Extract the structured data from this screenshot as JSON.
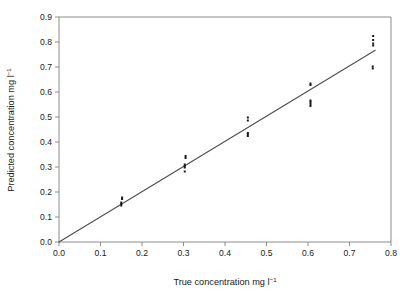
{
  "figure": {
    "background": "#ffffff",
    "frame_color": "#8c8c8c",
    "point_color": "#1a1a1a",
    "line_color": "#4d4d4d"
  },
  "chart_data": {
    "type": "scatter",
    "title": "",
    "xlabel_main": "True concentration mg l",
    "xlabel_sup": "−1",
    "ylabel_main": "Predicted concentration mg l",
    "ylabel_sup": "−1",
    "xlim": [
      0.0,
      0.8
    ],
    "ylim": [
      0.0,
      0.9
    ],
    "grid": false,
    "legend": "none",
    "xticks": [
      0.0,
      0.1,
      0.2,
      0.3,
      0.4,
      0.5,
      0.6,
      0.7,
      0.8
    ],
    "xtick_labels": [
      "0.0",
      "0.1",
      "0.2",
      "0.3",
      "0.4",
      "0.5",
      "0.6",
      "0.7",
      "0.8"
    ],
    "yticks": [
      0.0,
      0.1,
      0.2,
      0.3,
      0.4,
      0.5,
      0.6,
      0.7,
      0.8,
      0.9
    ],
    "ytick_labels": [
      "0.0",
      "0.1",
      "0.2",
      "0.3",
      "0.4",
      "0.5",
      "0.6",
      "0.7",
      "0.8",
      "0.9"
    ],
    "series": [
      {
        "name": "replicate measurements",
        "marker": "square",
        "marker_size": 2.0,
        "points": [
          [
            0.15,
            0.146
          ],
          [
            0.15,
            0.152
          ],
          [
            0.15,
            0.158
          ],
          [
            0.152,
            0.172
          ],
          [
            0.152,
            0.178
          ],
          [
            0.303,
            0.282
          ],
          [
            0.303,
            0.298
          ],
          [
            0.303,
            0.304
          ],
          [
            0.303,
            0.31
          ],
          [
            0.305,
            0.336
          ],
          [
            0.305,
            0.344
          ],
          [
            0.455,
            0.424
          ],
          [
            0.455,
            0.43
          ],
          [
            0.455,
            0.436
          ],
          [
            0.455,
            0.486
          ],
          [
            0.455,
            0.498
          ],
          [
            0.606,
            0.544
          ],
          [
            0.606,
            0.552
          ],
          [
            0.606,
            0.56
          ],
          [
            0.606,
            0.566
          ],
          [
            0.606,
            0.628
          ],
          [
            0.606,
            0.634
          ],
          [
            0.756,
            0.694
          ],
          [
            0.756,
            0.702
          ],
          [
            0.757,
            0.786
          ],
          [
            0.757,
            0.794
          ],
          [
            0.757,
            0.808
          ],
          [
            0.757,
            0.824
          ]
        ]
      }
    ],
    "fit_line": {
      "name": "regression line",
      "x_start": 0.0,
      "y_start": 0.0,
      "x_end": 0.762,
      "y_end": 0.767,
      "slope": 1.007,
      "intercept": 0.0
    }
  }
}
